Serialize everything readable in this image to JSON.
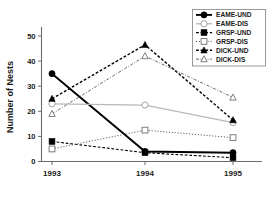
{
  "chart_data": {
    "type": "line",
    "title": "",
    "xlabel": "",
    "ylabel": "Number of Nests",
    "categories": [
      "1993",
      "1994",
      "1995"
    ],
    "x": [
      1993,
      1994,
      1995
    ],
    "xlim": [
      1992.7,
      1995.3
    ],
    "ylim": [
      0,
      52
    ],
    "yticks": [
      0,
      10,
      20,
      30,
      40,
      50
    ],
    "ytick_labels": [
      "0",
      "10",
      "20",
      "30",
      "40",
      "50"
    ],
    "xtick_labels": [
      "1993",
      "1994",
      "1995"
    ],
    "grid": false,
    "legend_position": "top-right",
    "series": [
      {
        "name": "EAME-UND",
        "values": [
          35,
          4,
          3.5
        ],
        "marker": "filled-circle",
        "line_style": "solid",
        "color": "#000000",
        "line_width": 1.9
      },
      {
        "name": "EAME-DIS",
        "values": [
          23,
          22.5,
          15.5
        ],
        "marker": "open-circle",
        "line_style": "solid",
        "color": "#b8b8b8",
        "line_width": 1.3
      },
      {
        "name": "GRSP-UND",
        "values": [
          8,
          3.5,
          1.5
        ],
        "marker": "filled-square",
        "line_style": "dashed",
        "color": "#000000",
        "line_width": 1.1
      },
      {
        "name": "GRSP-DIS",
        "values": [
          5,
          12.5,
          9.5
        ],
        "marker": "open-square",
        "line_style": "dotted",
        "color": "#555555",
        "line_width": 1.0
      },
      {
        "name": "DICK-UND",
        "values": [
          25,
          46.5,
          16.5
        ],
        "marker": "filled-triangle",
        "line_style": "dashed",
        "color": "#000000",
        "line_width": 1.4
      },
      {
        "name": "DICK-DIS",
        "values": [
          19,
          42,
          25.5
        ],
        "marker": "open-triangle",
        "line_style": "dashdot",
        "color": "#6a6a6a",
        "line_width": 1.0
      }
    ]
  },
  "legend": {
    "entries": [
      "EAME-UND",
      "EAME-DIS",
      "GRSP-UND",
      "GRSP-DIS",
      "DICK-UND",
      "DICK-DIS"
    ]
  }
}
